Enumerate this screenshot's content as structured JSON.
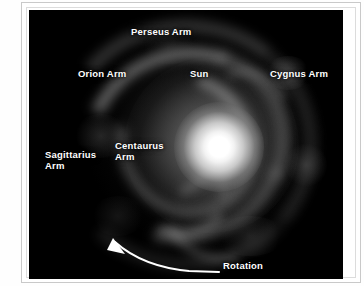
{
  "page": {
    "side_caption": "KNACK NIGHT SKY"
  },
  "figure": {
    "name": "milky-way-spiral-arms-diagram",
    "background_color": "#000000",
    "label_color": "#ffffff",
    "labels": [
      {
        "id": "perseus",
        "text": "Perseus Arm"
      },
      {
        "id": "orion",
        "text": "Orion Arm"
      },
      {
        "id": "sun",
        "text": "Sun"
      },
      {
        "id": "cygnus",
        "text": "Cygnus Arm"
      },
      {
        "id": "sagittarius",
        "text": "Sagittarius\nArm"
      },
      {
        "id": "centaurus",
        "text": "Centaurus\nArm"
      },
      {
        "id": "rotation",
        "text": "Rotation"
      }
    ]
  }
}
